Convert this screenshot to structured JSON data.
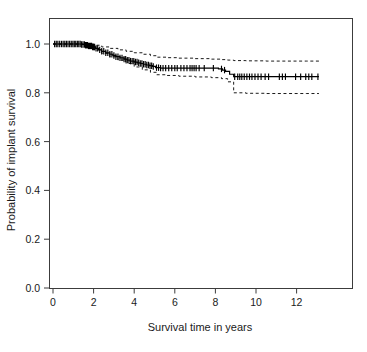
{
  "chart_data": {
    "type": "line",
    "title": "",
    "subtitle": "",
    "xlabel": "Survival time in years",
    "ylabel": "Probability of implant survival",
    "xlim": [
      -0.35,
      13.4
    ],
    "ylim": [
      0.0,
      1.04
    ],
    "xticks": [
      0,
      2,
      4,
      6,
      8,
      10,
      12
    ],
    "xticklabels": [
      "0",
      "2",
      "4",
      "6",
      "8",
      "10",
      "12"
    ],
    "yticks": [
      0.0,
      0.2,
      0.4,
      0.6,
      0.8,
      1.0
    ],
    "yticklabels": [
      "0.0",
      "0.2",
      "0.4",
      "0.6",
      "0.8",
      "1.0"
    ],
    "grid": false,
    "legend": false,
    "legend_position": "none",
    "line_color": "#000000",
    "ci_style": "dashed",
    "annotations": [],
    "series": [
      {
        "name": "Kaplan-Meier survival estimate",
        "style": "step",
        "x": [
          0.0,
          0.45,
          0.9,
          1.15,
          1.4,
          1.6,
          1.75,
          1.95,
          2.1,
          2.25,
          2.4,
          2.6,
          2.8,
          2.95,
          3.1,
          3.3,
          3.5,
          3.65,
          3.8,
          4.0,
          4.15,
          4.3,
          4.45,
          4.6,
          4.75,
          4.9,
          5.05,
          5.3,
          5.7,
          6.2,
          6.8,
          7.4,
          7.9,
          8.15,
          8.35,
          8.5,
          8.7,
          8.9,
          9.3,
          9.9,
          10.6,
          11.3,
          12.0,
          12.6,
          13.1
        ],
        "y": [
          1.0,
          1.0,
          1.0,
          1.0,
          0.998,
          0.995,
          0.992,
          0.988,
          0.982,
          0.976,
          0.97,
          0.964,
          0.958,
          0.953,
          0.948,
          0.943,
          0.938,
          0.934,
          0.93,
          0.926,
          0.923,
          0.92,
          0.917,
          0.914,
          0.911,
          0.908,
          0.903,
          0.901,
          0.901,
          0.901,
          0.901,
          0.901,
          0.901,
          0.898,
          0.893,
          0.888,
          0.876,
          0.866,
          0.866,
          0.866,
          0.866,
          0.866,
          0.866,
          0.866,
          0.866
        ]
      },
      {
        "name": "Upper 95% confidence limit",
        "style": "step-dashed",
        "x": [
          0.0,
          1.0,
          1.5,
          2.0,
          2.4,
          2.8,
          3.2,
          3.6,
          4.0,
          4.4,
          4.8,
          5.1,
          5.6,
          6.2,
          7.0,
          7.8,
          8.3,
          8.6,
          8.9,
          9.5,
          10.5,
          11.5,
          12.5,
          13.1
        ],
        "y": [
          1.0,
          1.0,
          1.0,
          0.995,
          0.988,
          0.982,
          0.976,
          0.97,
          0.964,
          0.958,
          0.952,
          0.946,
          0.944,
          0.942,
          0.94,
          0.938,
          0.936,
          0.934,
          0.932,
          0.931,
          0.93,
          0.93,
          0.93,
          0.93
        ]
      },
      {
        "name": "Lower 95% confidence limit",
        "style": "step-dashed",
        "x": [
          0.0,
          1.0,
          1.5,
          2.0,
          2.4,
          2.8,
          3.2,
          3.6,
          4.0,
          4.4,
          4.8,
          5.1,
          5.6,
          6.2,
          7.0,
          7.8,
          8.3,
          8.6,
          8.9,
          9.5,
          10.5,
          11.5,
          12.5,
          13.1
        ],
        "y": [
          1.0,
          1.0,
          0.994,
          0.977,
          0.962,
          0.948,
          0.934,
          0.92,
          0.906,
          0.894,
          0.884,
          0.874,
          0.871,
          0.868,
          0.865,
          0.862,
          0.858,
          0.845,
          0.8,
          0.798,
          0.797,
          0.797,
          0.797,
          0.797
        ]
      }
    ],
    "censor_marks": {
      "description": "Vertical tick marks on the survival curve indicating censored observations",
      "times": [
        0.08,
        0.16,
        0.24,
        0.33,
        0.42,
        0.5,
        0.58,
        0.66,
        0.74,
        0.82,
        0.9,
        0.98,
        1.05,
        1.12,
        1.2,
        1.27,
        1.34,
        1.41,
        1.48,
        1.55,
        1.6,
        1.65,
        1.7,
        1.75,
        1.8,
        1.85,
        1.9,
        1.95,
        2.0,
        2.05,
        2.12,
        2.2,
        2.3,
        2.4,
        2.5,
        2.6,
        2.7,
        2.8,
        2.9,
        3.0,
        3.1,
        3.2,
        3.3,
        3.4,
        3.5,
        3.58,
        3.66,
        3.74,
        3.82,
        3.9,
        3.98,
        4.06,
        4.14,
        4.22,
        4.3,
        4.38,
        4.46,
        4.54,
        4.62,
        4.7,
        4.78,
        4.86,
        4.94,
        5.1,
        5.2,
        5.3,
        5.42,
        5.55,
        5.7,
        5.85,
        6.0,
        6.12,
        6.3,
        6.45,
        6.6,
        6.75,
        6.85,
        6.95,
        7.05,
        7.2,
        7.45,
        7.9,
        8.3,
        8.45,
        8.95,
        9.1,
        9.2,
        9.3,
        9.42,
        9.55,
        9.68,
        9.8,
        9.95,
        10.1,
        10.25,
        10.45,
        10.62,
        11.15,
        11.3,
        11.45,
        11.95,
        12.2,
        12.45,
        12.6,
        12.75,
        13.05
      ]
    }
  }
}
